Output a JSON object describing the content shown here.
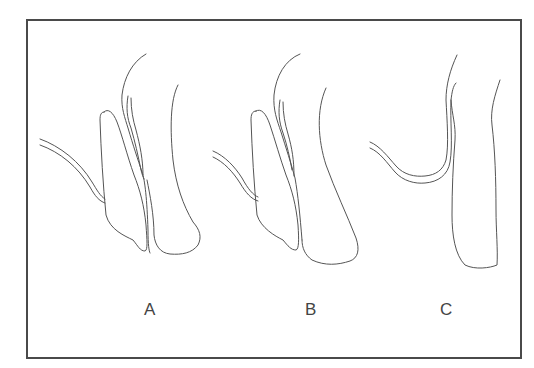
{
  "figure": {
    "panels": [
      {
        "id": "A",
        "label": "A"
      },
      {
        "id": "B",
        "label": "B"
      },
      {
        "id": "C",
        "label": "C"
      }
    ],
    "colors": {
      "line": "#555555",
      "frame": "#4a4a4a",
      "background": "#ffffff"
    }
  }
}
